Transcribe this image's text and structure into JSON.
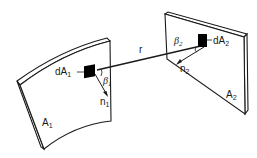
{
  "diagram": {
    "title": "",
    "surfaces": [
      {
        "id": "A1",
        "label": "A",
        "subscript": "1",
        "shape": "curved-panel"
      },
      {
        "id": "A2",
        "label": "A",
        "subscript": "2",
        "shape": "flat-panel"
      }
    ],
    "elements": [
      {
        "id": "dA1",
        "label": "dA",
        "subscript": "1",
        "on": "A1"
      },
      {
        "id": "dA2",
        "label": "dA",
        "subscript": "2",
        "on": "A2"
      }
    ],
    "normals": [
      {
        "id": "n1",
        "label": "n",
        "subscript": "1"
      },
      {
        "id": "n2",
        "label": "n",
        "subscript": "2"
      }
    ],
    "angles": [
      {
        "id": "beta1",
        "label": "β",
        "subscript": "1"
      },
      {
        "id": "beta2",
        "label": "β",
        "subscript": "2"
      }
    ],
    "connector": {
      "id": "r",
      "label": "r"
    },
    "colors": {
      "line": "#1a1a1a",
      "fill": "#ffffff",
      "element": "#000000"
    }
  }
}
